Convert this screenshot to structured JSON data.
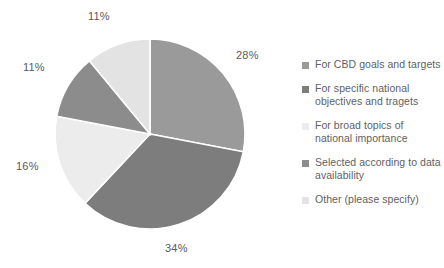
{
  "chart_data": {
    "type": "pie",
    "title": "",
    "categories": [
      "For CBD goals and targets",
      "For specific national objectives and tragets",
      "For broad topics of national importance",
      "Selected according to data availability",
      "Other (please specify)"
    ],
    "values": [
      28,
      34,
      16,
      11,
      11
    ],
    "value_labels": [
      "28%",
      "34%",
      "16%",
      "11%",
      "11%"
    ],
    "colors": [
      "#9a9a9a",
      "#7d7d7d",
      "#ececec",
      "#8c8c8c",
      "#e3e3e3"
    ],
    "legend_position": "right",
    "grid": false,
    "start_angle_deg": 0,
    "direction": "clockwise",
    "units": "percent"
  },
  "labels": {
    "slice_0": "28%",
    "slice_1": "34%",
    "slice_2": "16%",
    "slice_3": "11%",
    "slice_4": "11%"
  },
  "legend": {
    "items": [
      {
        "label": "For CBD goals and targets",
        "color": "#9a9a9a"
      },
      {
        "label": "For specific national objectives and tragets",
        "color": "#7d7d7d"
      },
      {
        "label": "For broad topics of national importance",
        "color": "#ececec"
      },
      {
        "label": "Selected according to data availability",
        "color": "#8c8c8c"
      },
      {
        "label": "Other (please specify)",
        "color": "#e3e3e3"
      }
    ]
  },
  "style": {
    "background": "#ffffff",
    "label_color": "#5a5a5a",
    "legend_text_color": "#5f5f5f",
    "slice_separator": "#ffffff"
  }
}
